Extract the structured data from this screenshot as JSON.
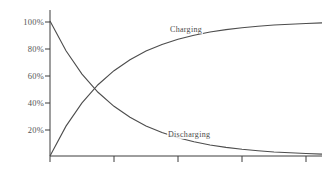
{
  "chart_data": {
    "type": "line",
    "title": "",
    "subtitle": "",
    "xlabel": "",
    "ylabel": "",
    "grid": false,
    "legend_position": "inline-annotation",
    "xlim": [
      0,
      5
    ],
    "ylim": [
      0,
      1.1
    ],
    "x_tick_values": [
      0,
      1,
      2,
      3,
      4
    ],
    "x_tick_labels": [
      "",
      "",
      "",
      "",
      ""
    ],
    "y_tick_values": [
      0.2,
      0.4,
      0.6,
      0.8,
      1.0
    ],
    "y_tick_labels": [
      "20%",
      "40%",
      "60%",
      "80%",
      "100%"
    ],
    "x": [
      0,
      0.25,
      0.5,
      0.75,
      1,
      1.25,
      1.5,
      1.75,
      2,
      2.25,
      2.5,
      2.75,
      3,
      3.25,
      3.5,
      3.75,
      4,
      4.25
    ],
    "series": [
      {
        "name": "Charging",
        "formula": "1 - exp(-x)",
        "color": "#4d4d4d",
        "values": [
          0,
          0.221,
          0.393,
          0.528,
          0.632,
          0.713,
          0.777,
          0.826,
          0.865,
          0.895,
          0.918,
          0.936,
          0.95,
          0.961,
          0.97,
          0.976,
          0.982,
          0.986
        ]
      },
      {
        "name": "Discharging",
        "formula": "exp(-x)",
        "color": "#4d4d4d",
        "values": [
          1.0,
          0.779,
          0.607,
          0.472,
          0.368,
          0.287,
          0.223,
          0.174,
          0.135,
          0.105,
          0.082,
          0.064,
          0.05,
          0.039,
          0.03,
          0.024,
          0.018,
          0.014
        ]
      }
    ],
    "annotations": [
      {
        "name": "charging-label",
        "text": "Charging"
      },
      {
        "name": "discharging-label",
        "text": "Discharging"
      }
    ],
    "axis_color": "#3c3c3c",
    "line_color": "#4d4d4d",
    "background_color": "#ffffff"
  },
  "axis": {
    "y_labels": [
      "100%",
      "80%",
      "60%",
      "40%",
      "20%"
    ],
    "x_labels": [
      "",
      "",
      "",
      "",
      ""
    ]
  },
  "labels": {
    "charging": "Charging",
    "discharging": "Discharging"
  }
}
